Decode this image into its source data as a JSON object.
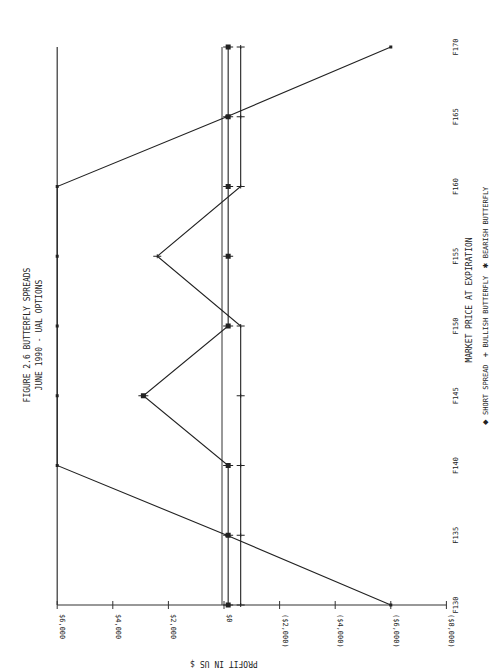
{
  "chart_data": {
    "type": "line",
    "title": "FIGURE 2.6 BUTTERFLY SPREADS",
    "subtitle": "JUNE 1990 - UAL OPTIONS",
    "xlabel": "MARKET PRICE AT EXPIRATION",
    "ylabel": "PROFIT IN US $",
    "orientation": "rotated 90 degrees counter-clockwise on page",
    "x": [
      130,
      135,
      140,
      145,
      150,
      155,
      160,
      165,
      170
    ],
    "x_tick_labels": [
      "F130",
      "F135",
      "F140",
      "F145",
      "F150",
      "F155",
      "F160",
      "F165",
      "F170"
    ],
    "y_tick_values": [
      6000,
      4000,
      2000,
      0,
      -2000,
      -4000,
      -6000,
      -8000
    ],
    "y_tick_labels": [
      "$6,000",
      "$4,000",
      "$2,000",
      "$0",
      "($2,000)",
      "($4,000)",
      "($6,000)",
      "($8,000)"
    ],
    "ylim": [
      -8000,
      6000
    ],
    "xlim": [
      130,
      170
    ],
    "grid": false,
    "legend_position": "below x-axis label",
    "series": [
      {
        "name": "SHORT SPREAD",
        "marker": "diamond",
        "values": [
          -6000,
          -100,
          6000,
          6000,
          6000,
          6000,
          6000,
          -100,
          -6000
        ]
      },
      {
        "name": "BULLISH BUTTERFLY",
        "marker": "plus",
        "values": [
          -600,
          -600,
          -600,
          -600,
          -600,
          2400,
          -600,
          -600,
          -600
        ]
      },
      {
        "name": "BEARISH BUTTERFLY",
        "marker": "star",
        "values": [
          -150,
          -150,
          -150,
          2900,
          -150,
          -150,
          -150,
          -150,
          -150
        ]
      }
    ]
  },
  "legend": [
    {
      "symbol": "◆",
      "label": "SHORT SPREAD"
    },
    {
      "symbol": "+",
      "label": "BULLISH BUTTERFLY"
    },
    {
      "symbol": "✱",
      "label": "BEARISH BUTTERFLY"
    }
  ]
}
